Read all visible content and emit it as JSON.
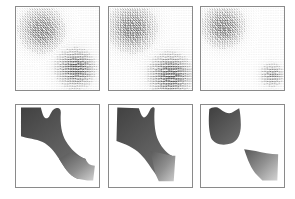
{
  "figure": {
    "title": "",
    "caption": "",
    "rows": 2,
    "columns": 3,
    "background_color": "#ffffff",
    "panel_border_color": "#8a8a8a"
  },
  "chart_data": {
    "type": "quiver",
    "title": "",
    "subtitle": "",
    "xlabel": "",
    "ylabel": "",
    "grid": false,
    "legend": null,
    "panel_grid": {
      "rows": 2,
      "columns": 3
    },
    "row_labels": [
      "motion vector field",
      "segmentation / shading result"
    ],
    "column_labels": [
      "frame 1",
      "frame 2",
      "frame 3"
    ],
    "axis_ranges": {
      "x": [
        0,
        1
      ],
      "y": [
        0,
        1
      ]
    },
    "quiver_grid": {
      "nx": 34,
      "ny": 34,
      "arrow_color": "#303030",
      "background": "#ffffff"
    },
    "panels": [
      {
        "id": "quiver-1",
        "row": 0,
        "column": 0,
        "type": "quiver",
        "description": "two divergent flow lobes: upper-left lobe with down-right arrows, lower-right lobe with right-pointing arrows",
        "regions": [
          {
            "name": "upper-left-lobe",
            "center": [
              0.3,
              0.74
            ],
            "radius": 0.3,
            "direction_deg": -55,
            "magnitude": 1.0
          },
          {
            "name": "lower-right-lobe",
            "center": [
              0.7,
              0.26
            ],
            "radius": 0.28,
            "direction_deg": 5,
            "magnitude": 0.9
          },
          {
            "name": "quiet-background",
            "center": [
              0.5,
              0.5
            ],
            "radius": 1.0,
            "direction_deg": 0,
            "magnitude": 0.05
          }
        ]
      },
      {
        "id": "quiver-2",
        "row": 0,
        "column": 1,
        "type": "quiver",
        "description": "upper-left lobe stronger and tilted, lower-right lobe shifted toward bottom edge",
        "regions": [
          {
            "name": "upper-left-lobe",
            "center": [
              0.27,
              0.76
            ],
            "radius": 0.32,
            "direction_deg": -62,
            "magnitude": 1.0
          },
          {
            "name": "lower-right-lobe",
            "center": [
              0.72,
              0.18
            ],
            "radius": 0.3,
            "direction_deg": 8,
            "magnitude": 0.95
          },
          {
            "name": "quiet-background",
            "center": [
              0.5,
              0.5
            ],
            "radius": 1.0,
            "direction_deg": 0,
            "magnitude": 0.05
          }
        ]
      },
      {
        "id": "quiver-3",
        "row": 0,
        "column": 2,
        "type": "quiver",
        "description": "single compact upper-left lobe plus a small band of right-pointing arrows at lower-right corner",
        "regions": [
          {
            "name": "upper-left-lobe",
            "center": [
              0.26,
              0.78
            ],
            "radius": 0.28,
            "direction_deg": -60,
            "magnitude": 1.0
          },
          {
            "name": "lower-right-band",
            "center": [
              0.84,
              0.18
            ],
            "radius": 0.18,
            "direction_deg": 0,
            "magnitude": 0.7
          },
          {
            "name": "quiet-background",
            "center": [
              0.5,
              0.5
            ],
            "radius": 1.0,
            "direction_deg": 0,
            "magnitude": 0.03
          }
        ]
      },
      {
        "id": "shape-1",
        "row": 1,
        "column": 0,
        "type": "region",
        "description": "single connected S-shaped region: dark upper-left blob joined by a narrow neck to a gradient-shaded lower-right lobe",
        "shapes": [
          {
            "name": "upper-left-blob",
            "fill": "dark",
            "fill_start": "#4a4a4a",
            "fill_end": "#6e6e6e"
          },
          {
            "name": "lower-right-lobe",
            "fill": "gradient",
            "fill_start": "#5a5a5a",
            "fill_end": "#c8c8c8"
          }
        ]
      },
      {
        "id": "shape-2",
        "row": 1,
        "column": 1,
        "type": "region",
        "description": "connected region with thicker neck; dark upper-left blob and gradient lower-right lobe reaching the bottom edge",
        "shapes": [
          {
            "name": "upper-left-blob",
            "fill": "dark",
            "fill_start": "#4a4a4a",
            "fill_end": "#6e6e6e"
          },
          {
            "name": "lower-right-lobe",
            "fill": "gradient",
            "fill_start": "#5e5e5e",
            "fill_end": "#c4c4c4"
          }
        ]
      },
      {
        "id": "shape-3",
        "row": 1,
        "column": 2,
        "type": "region",
        "description": "two disconnected regions: dark upper-left quadrilateral blob and separate gradient lower-right lobe",
        "shapes": [
          {
            "name": "upper-left-blob",
            "fill": "dark",
            "fill_start": "#484848",
            "fill_end": "#6a6a6a"
          },
          {
            "name": "lower-right-lobe",
            "fill": "gradient",
            "fill_start": "#606060",
            "fill_end": "#cdcdcd"
          }
        ]
      }
    ],
    "colors": {
      "dark_region": "#4a4a4a",
      "light_region": "#c8c8c8",
      "arrow": "#303030",
      "frame": "#8a8a8a",
      "background": "#ffffff"
    }
  }
}
